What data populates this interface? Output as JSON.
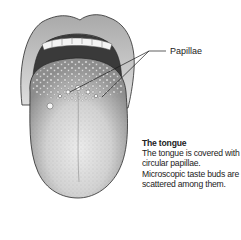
{
  "figure": {
    "labels": [
      {
        "id": "papillae",
        "text": "Papillae"
      }
    ]
  },
  "caption": {
    "title": "The tongue",
    "body": "The tongue is covered with circular papillae. Microscopic taste buds are scattered among them."
  },
  "colors": {
    "lip": "#cfcfcf",
    "mouth_dark": "#3a3a3a",
    "teeth": "#f4f4f4",
    "tongue": "#bdbdbd",
    "tongue_light": "#e2e2e2",
    "outline": "#2a2a2a",
    "leader_line": "#1a1a1a"
  }
}
